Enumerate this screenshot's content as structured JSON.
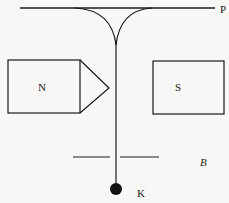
{
  "diagram": {
    "labels": {
      "plate": "P",
      "north_pole": "N",
      "south_pole": "S",
      "field": "B",
      "bob": "K"
    },
    "colors": {
      "stroke": "#1a1a1a",
      "background": "#f7f7f5"
    }
  }
}
